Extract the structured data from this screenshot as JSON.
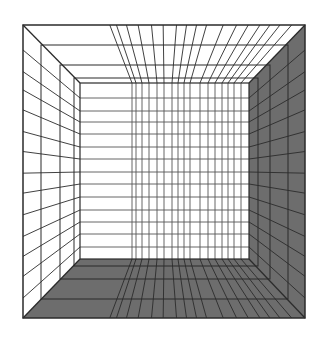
{
  "figure": {
    "title": "Perspective grid room (one-point perspective box interior)",
    "width": 327,
    "height": 339
  },
  "colors": {
    "background": "#ffffff",
    "wall_light": "#ffffff",
    "wall_dark": "#6d6d6d",
    "line": "#2b2b2b",
    "line_light": "#555555"
  },
  "geometry": {
    "outer": {
      "left": 23,
      "top": 25,
      "right": 305,
      "bottom": 318
    },
    "inner": {
      "left": 80,
      "top": 83,
      "right": 249,
      "bottom": 259
    },
    "depth_frames": [
      {
        "left": 41,
        "top": 45,
        "right": 288,
        "bottom": 299
      },
      {
        "left": 60,
        "top": 65,
        "right": 270,
        "bottom": 279
      },
      {
        "left": 74,
        "top": 78,
        "right": 258,
        "bottom": 266
      }
    ],
    "back_wall_verticals": [
      132,
      136,
      142,
      149,
      157,
      164,
      172,
      178,
      184,
      190,
      200,
      208,
      215,
      222,
      228,
      234,
      241
    ],
    "back_wall_horizontals": [
      98,
      111,
      122,
      134,
      147,
      159,
      172,
      184,
      197,
      210,
      222,
      234,
      247
    ],
    "floor_verticals": [
      132,
      136,
      142,
      149,
      157,
      164,
      172,
      178,
      184,
      190,
      200,
      208,
      215,
      222,
      228,
      234,
      241
    ],
    "left_wall_horizontals": [
      98,
      111,
      122,
      134,
      147,
      159,
      172,
      184,
      197,
      210,
      222,
      234,
      247
    ],
    "right_wall_horizontals": [
      98,
      111,
      122,
      134,
      147,
      159,
      172,
      184,
      197,
      210,
      222,
      234,
      247
    ]
  },
  "faces": {
    "ceiling": "light",
    "left_wall": "light",
    "back_wall": "light",
    "right_wall": "dark",
    "floor": "dark"
  }
}
